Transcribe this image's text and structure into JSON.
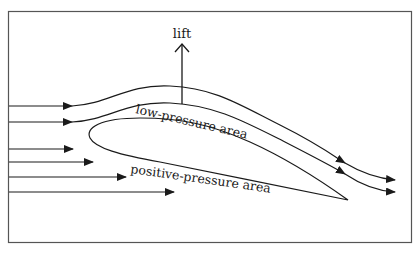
{
  "diagram": {
    "title_label": "lift",
    "labels": {
      "upper": "low-pressure area",
      "lower": "positive-pressure area"
    },
    "colors": {
      "stroke": "#1a1a1a",
      "frame": "#555555",
      "background": "#ffffff"
    }
  }
}
